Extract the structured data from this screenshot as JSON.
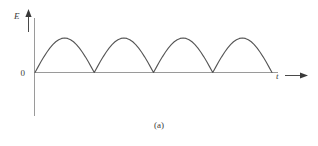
{
  "figure": {
    "caption": "(a)",
    "y_axis_label": "E",
    "x_axis_label": "t",
    "origin_label": "0"
  },
  "colors": {
    "background": "#ffffff",
    "axis": "#9a9a9a",
    "curve": "#555555",
    "text": "#3c3c3c",
    "arrow": "#3a3a3a"
  },
  "chart_data": {
    "type": "line",
    "title": "(a)",
    "xlabel": "t",
    "ylabel": "E",
    "grid": false,
    "legend": null,
    "xlim": [
      0,
      4
    ],
    "ylim": [
      0,
      1.15
    ],
    "xticks": [],
    "yticks": [
      0
    ],
    "ytick_labels": [
      "0"
    ],
    "series": [
      {
        "name": "Full-wave rectified sine",
        "equation": "E = |sin(pi * t)|",
        "period": 1,
        "amplitude": 1,
        "arch_count": 4,
        "zero_crossings_t": [
          0,
          1,
          2,
          3,
          4
        ],
        "peaks_t": [
          0.5,
          1.5,
          2.5,
          3.5
        ],
        "peaks_E": [
          1,
          1,
          1,
          1
        ],
        "x": [
          0,
          0.05,
          0.1,
          0.15,
          0.2,
          0.25,
          0.3,
          0.35,
          0.4,
          0.45,
          0.5,
          0.55,
          0.6,
          0.65,
          0.7,
          0.75,
          0.8,
          0.85,
          0.9,
          0.95,
          1.0,
          1.05,
          1.1,
          1.15,
          1.2,
          1.25,
          1.3,
          1.35,
          1.4,
          1.45,
          1.5,
          1.55,
          1.6,
          1.65,
          1.7,
          1.75,
          1.8,
          1.85,
          1.9,
          1.95,
          2.0,
          2.05,
          2.1,
          2.15,
          2.2,
          2.25,
          2.3,
          2.35,
          2.4,
          2.45,
          2.5,
          2.55,
          2.6,
          2.65,
          2.7,
          2.75,
          2.8,
          2.85,
          2.9,
          2.95,
          3.0,
          3.05,
          3.1,
          3.15,
          3.2,
          3.25,
          3.3,
          3.35,
          3.4,
          3.45,
          3.5,
          3.55,
          3.6,
          3.65,
          3.7,
          3.75,
          3.8,
          3.85,
          3.9,
          3.95,
          4.0
        ],
        "y": [
          0,
          0.156,
          0.309,
          0.454,
          0.588,
          0.707,
          0.809,
          0.891,
          0.951,
          0.988,
          1.0,
          0.988,
          0.951,
          0.891,
          0.809,
          0.707,
          0.588,
          0.454,
          0.309,
          0.156,
          0,
          0.156,
          0.309,
          0.454,
          0.588,
          0.707,
          0.809,
          0.891,
          0.951,
          0.988,
          1.0,
          0.988,
          0.951,
          0.891,
          0.809,
          0.707,
          0.588,
          0.454,
          0.309,
          0.156,
          0,
          0.156,
          0.309,
          0.454,
          0.588,
          0.707,
          0.809,
          0.891,
          0.951,
          0.988,
          1.0,
          0.988,
          0.951,
          0.891,
          0.809,
          0.707,
          0.588,
          0.454,
          0.309,
          0.156,
          0,
          0.156,
          0.309,
          0.454,
          0.588,
          0.707,
          0.809,
          0.891,
          0.951,
          0.988,
          1.0,
          0.988,
          0.951,
          0.891,
          0.809,
          0.707,
          0.588,
          0.454,
          0.309,
          0.156,
          0
        ]
      }
    ]
  }
}
